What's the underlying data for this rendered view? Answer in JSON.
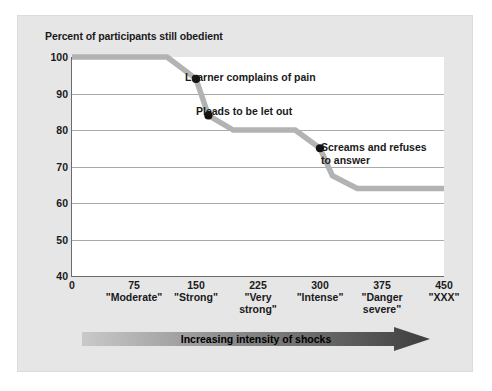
{
  "figure": {
    "title": "Percent of participants still obedient",
    "axis_arrow_label": "Increasing intensity of shocks",
    "background_color": "#e6e6e6",
    "plot_background_color": "#ffffff",
    "line_color": "#b3b3b3",
    "marker_color": "#111111",
    "gridline_color": "#a9a9a9",
    "arrow_gradient_from": "#c8c8c8",
    "arrow_gradient_to": "#3f3f3f"
  },
  "chart_data": {
    "type": "line",
    "title": "Percent of participants still obedient",
    "xlabel": "Increasing intensity of shocks",
    "ylabel": "Percent of participants still obedient",
    "xlim": [
      0,
      450
    ],
    "ylim": [
      40,
      100
    ],
    "grid": true,
    "legend": "none",
    "x_ticks": [
      0,
      75,
      150,
      225,
      300,
      375,
      450
    ],
    "x_tick_labels": [
      "0",
      "75",
      "150",
      "225",
      "300",
      "375",
      "450"
    ],
    "x_tick_names": [
      "",
      "\"Moderate\"",
      "\"Strong\"",
      "\"Very strong\"",
      "\"Intense\"",
      "\"Danger severe\"",
      "\"XXX\""
    ],
    "y_ticks": [
      40,
      50,
      60,
      70,
      80,
      90,
      100
    ],
    "y_tick_labels": [
      "40",
      "50",
      "60",
      "70",
      "80",
      "90",
      "100"
    ],
    "series": [
      {
        "name": "Percent still obedient",
        "x": [
          0,
          115,
          150,
          165,
          195,
          270,
          300,
          315,
          345,
          450
        ],
        "y": [
          100,
          100,
          94,
          84,
          80,
          80,
          75,
          67.5,
          64,
          64
        ]
      }
    ],
    "markers": [
      {
        "x": 150,
        "y": 94,
        "label": "Learner complains of pain"
      },
      {
        "x": 165,
        "y": 84,
        "label": "Pleads to be let out"
      },
      {
        "x": 300,
        "y": 75,
        "label": "Screams and refuses\nto answer"
      }
    ]
  }
}
